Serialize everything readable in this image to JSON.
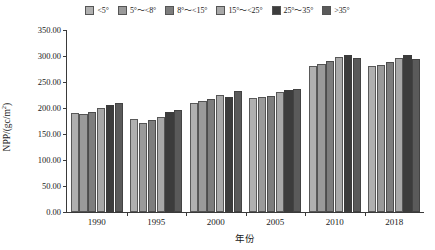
{
  "chart_data": {
    "type": "bar",
    "title": "",
    "xlabel": "年份",
    "ylabel": "NPP/(gc/m²)",
    "categories": [
      "1990",
      "1995",
      "2000",
      "2005",
      "2010",
      "2018"
    ],
    "ylim": [
      0,
      350
    ],
    "ytick_values": [
      0,
      50,
      100,
      150,
      200,
      250,
      300,
      350
    ],
    "ytick_labels": [
      "0.00",
      "50.00",
      "100.00",
      "150.00",
      "200.00",
      "250.00",
      "300.00",
      "350.00"
    ],
    "grid": false,
    "legend_position": "top-center",
    "series": [
      {
        "name": "<5°",
        "color": "#b0b0b0",
        "values": [
          190,
          178,
          210,
          220,
          281,
          281
        ]
      },
      {
        "name": "5°～<8°",
        "color": "#9a9a9a",
        "values": [
          188,
          172,
          214,
          222,
          285,
          283
        ]
      },
      {
        "name": "8°～<15°",
        "color": "#7d7d7d",
        "values": [
          193,
          176,
          218,
          224,
          290,
          289
        ]
      },
      {
        "name": "15°～<25°",
        "color": "#a8a8a8",
        "values": [
          200,
          183,
          225,
          230,
          298,
          297
        ]
      },
      {
        "name": "25°～35°",
        "color": "#3c3c3c",
        "values": [
          206,
          192,
          221,
          234,
          302,
          302
        ]
      },
      {
        "name": ">35°",
        "color": "#5a5a5a",
        "values": [
          210,
          196,
          233,
          237,
          296,
          295
        ]
      }
    ]
  }
}
